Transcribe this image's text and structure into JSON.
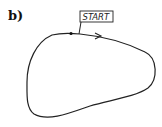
{
  "panel_label": "b)",
  "diagram": {
    "start_label": "START",
    "stroke_color": "#222222",
    "elements": [
      "closed-loop-curve",
      "start-point",
      "direction-arrow",
      "start-callout-box"
    ]
  }
}
